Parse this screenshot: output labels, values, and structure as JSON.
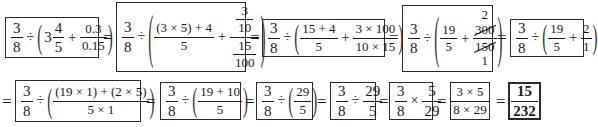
{
  "row1": {
    "box1": {
      "a_num": "3",
      "a_den": "8",
      "div": "÷",
      "lparen": "(",
      "whole": "3",
      "b_num": "4",
      "b_den": "5",
      "plus": "+",
      "c_num": "0.3",
      "c_den": "0.15",
      "rparen": ")"
    },
    "eq1": "=",
    "box2": {
      "a_num": "3",
      "a_den": "8",
      "div": "÷",
      "lparen": "(",
      "b_num": "(3 × 5) + 4",
      "b_den": "5",
      "plus": "+",
      "c_num_num": "3",
      "c_num_den": "10",
      "c_den_num": "15",
      "c_den_den": "100",
      "rparen": ")"
    },
    "eq2": "=",
    "box3": {
      "a_num": "3",
      "a_den": "8",
      "div": "÷",
      "lparen": "(",
      "b_num": "15 + 4",
      "b_den": "5",
      "plus": "+",
      "c_num": "3 × 100",
      "c_den": "10 × 15",
      "rparen": ")"
    },
    "eq3": "=",
    "box4": {
      "a_num": "3",
      "a_den": "8",
      "div": "÷",
      "lparen": "(",
      "b_num": "19",
      "b_den": "5",
      "plus": "+",
      "c_cancel_top": "2",
      "c_num": "300",
      "c_den": "150",
      "c_cancel_bottom": "1",
      "rparen": ")"
    },
    "eq4": "=",
    "box5": {
      "a_num": "3",
      "a_den": "8",
      "div": "÷",
      "lparen": "(",
      "b_num": "19",
      "b_den": "5",
      "plus": "+",
      "c_num": "2",
      "c_den": "1",
      "rparen": ")"
    }
  },
  "row2": {
    "eq0": "=",
    "box6": {
      "a_num": "3",
      "a_den": "8",
      "div": "÷",
      "lparen": "(",
      "b_num": "(19 × 1) + (2 × 5)",
      "b_den": "5 × 1",
      "rparen": ")"
    },
    "eq1": "=",
    "box7": {
      "a_num": "3",
      "a_den": "8",
      "div": "÷",
      "lparen": "(",
      "b_num": "19 + 10",
      "b_den": "5",
      "rparen": ")"
    },
    "eq2": "=",
    "box8": {
      "a_num": "3",
      "a_den": "8",
      "div": "÷",
      "lparen": "(",
      "b_num": "29",
      "b_den": "5",
      "rparen": ")"
    },
    "eq3": "=",
    "box9": {
      "a_num": "3",
      "a_den": "8",
      "div": "÷",
      "b_num": "29",
      "b_den": "5"
    },
    "eq4": "=",
    "box10": {
      "a_num": "3",
      "a_den": "8",
      "mul": "×",
      "b_num": "5",
      "b_den": "29"
    },
    "eq5": "=",
    "box11": {
      "num": "3 × 5",
      "den": "8 × 29"
    },
    "eq6": "=",
    "box12": {
      "num": "15",
      "den": "232"
    }
  }
}
